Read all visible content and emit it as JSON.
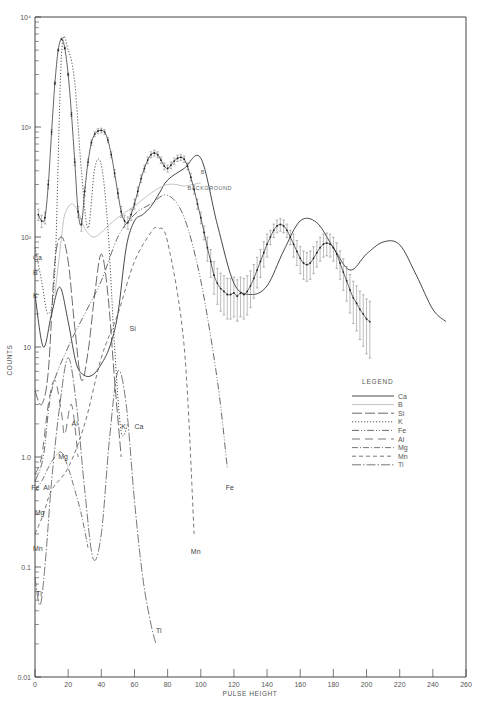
{
  "chart_data": {
    "type": "line",
    "title": "",
    "xlabel": "PULSE HEIGHT",
    "ylabel": "COUNTS",
    "yscale": "log",
    "xlim": [
      0,
      260
    ],
    "ylim": [
      0.01,
      10000
    ],
    "grid": false,
    "x_ticks": [
      0,
      20,
      40,
      60,
      80,
      100,
      120,
      140,
      160,
      180,
      200,
      220,
      240,
      260
    ],
    "y_ticks": [
      {
        "value": 0.01,
        "label": "0.01"
      },
      {
        "value": 0.1,
        "label": "0.1"
      },
      {
        "value": 1,
        "label": "1.0"
      },
      {
        "value": 10,
        "label": "10"
      },
      {
        "value": 100,
        "label": "10²"
      },
      {
        "value": 1000,
        "label": "10³"
      },
      {
        "value": 10000,
        "label": "10⁴"
      }
    ],
    "legend": {
      "title": "LEGEND",
      "position": "right-middle",
      "entries": [
        {
          "name": "Ca",
          "style": "solid"
        },
        {
          "name": "B",
          "style": "faint-solid"
        },
        {
          "name": "Si",
          "style": "long-dash"
        },
        {
          "name": "K",
          "style": "dotted"
        },
        {
          "name": "Fe",
          "style": "dash-dot-dot"
        },
        {
          "name": "Al",
          "style": "dash-long-gap"
        },
        {
          "name": "Mg",
          "style": "dash-dot"
        },
        {
          "name": "Mn",
          "style": "dashed"
        },
        {
          "name": "Ti",
          "style": "dash-dot-long"
        }
      ]
    },
    "annotations": [
      {
        "text": "BACKGROUND",
        "x": 92,
        "y": 270
      },
      {
        "text": "B",
        "x": 100,
        "y": 370
      }
    ],
    "measured": {
      "name": "Measured spectrum (with error bars)",
      "x": [
        2,
        4,
        6,
        8,
        10,
        12,
        14,
        16,
        18,
        20,
        22,
        24,
        26,
        28,
        30,
        32,
        34,
        36,
        38,
        40,
        42,
        44,
        46,
        48,
        50,
        52,
        54,
        56,
        58,
        60,
        62,
        64,
        66,
        68,
        70,
        72,
        74,
        76,
        78,
        80,
        82,
        84,
        86,
        88,
        90,
        92,
        94,
        96,
        98,
        100,
        102,
        104,
        106,
        108,
        110,
        112,
        114,
        116,
        118,
        120,
        122,
        124,
        126,
        128,
        130,
        132,
        134,
        136,
        138,
        140,
        142,
        144,
        146,
        148,
        150,
        152,
        154,
        156,
        158,
        160,
        162,
        164,
        166,
        168,
        170,
        172,
        174,
        176,
        178,
        180,
        182,
        184,
        186,
        188,
        190,
        192,
        194,
        196,
        198,
        200,
        202,
        204,
        206,
        208,
        210,
        212,
        214,
        216,
        218,
        220,
        222,
        224,
        226,
        228,
        230,
        232,
        234,
        236,
        238,
        240,
        242,
        244,
        246,
        248
      ],
      "y": [
        160,
        140,
        150,
        300,
        900,
        2500,
        5000,
        6300,
        5200,
        3000,
        1300,
        480,
        170,
        130,
        260,
        480,
        720,
        860,
        920,
        930,
        900,
        760,
        560,
        380,
        250,
        170,
        140,
        135,
        160,
        200,
        260,
        340,
        420,
        500,
        560,
        580,
        560,
        500,
        440,
        420,
        450,
        490,
        520,
        530,
        510,
        440,
        350,
        270,
        200,
        150,
        110,
        80,
        60,
        45,
        38,
        34,
        32,
        30,
        30,
        31,
        29,
        31,
        30,
        32,
        36,
        42,
        50,
        60,
        72,
        86,
        100,
        115,
        126,
        130,
        126,
        115,
        100,
        86,
        74,
        64,
        58,
        56,
        58,
        64,
        72,
        80,
        86,
        88,
        86,
        80,
        70,
        58,
        48,
        40,
        33,
        28,
        25,
        22,
        20,
        18,
        17
      ]
    },
    "series": [
      {
        "name": "Ca",
        "style": "solid",
        "x": [
          0,
          5,
          10,
          15,
          20,
          25,
          30,
          35,
          40,
          45,
          50,
          55,
          60,
          65,
          70,
          75,
          80,
          90,
          100,
          110,
          120,
          130,
          140,
          150,
          160,
          170,
          180,
          190,
          200,
          210,
          220,
          230,
          240,
          248
        ],
        "y": [
          30,
          10,
          20,
          35,
          17,
          7,
          5.5,
          5.6,
          7,
          10,
          20,
          80,
          140,
          160,
          190,
          250,
          330,
          420,
          520,
          130,
          38,
          30,
          36,
          75,
          140,
          135,
          80,
          50,
          70,
          90,
          85,
          45,
          22,
          17
        ]
      },
      {
        "name": "B",
        "style": "faint-solid",
        "x": [
          12,
          16,
          18,
          22,
          26,
          30,
          35,
          40,
          45,
          50,
          55,
          60,
          65,
          70,
          75,
          80,
          85,
          90,
          95,
          100
        ],
        "y": [
          30,
          100,
          160,
          200,
          170,
          120,
          100,
          110,
          130,
          150,
          170,
          190,
          220,
          250,
          280,
          300,
          300,
          290,
          300,
          310
        ]
      },
      {
        "name": "Si",
        "style": "long-dash",
        "x": [
          0,
          4,
          8,
          12,
          16,
          20,
          24,
          28,
          32,
          36,
          40,
          44,
          48,
          52
        ],
        "y": [
          4,
          3,
          6,
          60,
          100,
          60,
          15,
          5,
          9,
          30,
          70,
          30,
          5,
          1
        ]
      },
      {
        "name": "K",
        "style": "dotted",
        "x": [
          0,
          4,
          8,
          12,
          16,
          20,
          24,
          28,
          32,
          36,
          40,
          44,
          48,
          52,
          56
        ],
        "y": [
          80,
          40,
          20,
          50,
          4500,
          5000,
          2500,
          400,
          120,
          420,
          450,
          120,
          10,
          1.7,
          2
        ]
      },
      {
        "name": "Fe",
        "style": "dash-dot-dot",
        "x": [
          0,
          5,
          10,
          20,
          30,
          40,
          50,
          60,
          70,
          80,
          90,
          100,
          110,
          116
        ],
        "y": [
          0.6,
          1,
          4,
          10,
          20,
          40,
          100,
          160,
          200,
          240,
          150,
          40,
          5,
          0.8
        ]
      },
      {
        "name": "Al",
        "style": "dash-long-gap",
        "x": [
          0,
          4,
          8,
          12,
          16,
          18,
          22,
          26
        ],
        "y": [
          0.7,
          1,
          3,
          5,
          2.5,
          1.6,
          3,
          1
        ]
      },
      {
        "name": "Mg",
        "style": "dash-dot",
        "x": [
          0,
          4,
          8,
          12,
          16,
          20,
          24,
          28,
          32
        ],
        "y": [
          0.5,
          0.6,
          0.8,
          1.0,
          1.1,
          0.8,
          0.5,
          0.3,
          0.15
        ]
      },
      {
        "name": "Mn",
        "style": "dashed",
        "x": [
          0,
          5,
          10,
          20,
          30,
          40,
          50,
          60,
          70,
          74,
          80,
          90,
          96
        ],
        "y": [
          0.2,
          0.3,
          0.5,
          0.8,
          2,
          8,
          20,
          60,
          110,
          120,
          90,
          10,
          0.2
        ]
      },
      {
        "name": "Ti",
        "style": "dash-dot-long",
        "x": [
          0,
          3,
          6,
          10,
          15,
          20,
          25,
          30,
          35,
          40,
          45,
          50,
          55,
          60,
          65,
          70,
          73
        ],
        "y": [
          0.08,
          0.045,
          0.1,
          0.6,
          3,
          8,
          3,
          0.5,
          0.12,
          0.2,
          1.5,
          6,
          3,
          0.4,
          0.08,
          0.03,
          0.02
        ]
      }
    ],
    "curve_labels": [
      {
        "text": "Ca",
        "x": 0,
        "y": 62
      },
      {
        "text": "B",
        "x": 0,
        "y": 45
      },
      {
        "text": "K",
        "x": 0,
        "y": 28
      },
      {
        "text": "Si",
        "x": 57,
        "y": 14
      },
      {
        "text": "K",
        "x": 52,
        "y": 1.8
      },
      {
        "text": "Ca",
        "x": 60,
        "y": 1.8
      },
      {
        "text": "Al",
        "x": 22,
        "y": 1.9
      },
      {
        "text": "Mg",
        "x": 14,
        "y": 0.95
      },
      {
        "text": "Fe",
        "x": -1,
        "y": 0.5
      },
      {
        "text": "Al",
        "x": 5,
        "y": 0.5
      },
      {
        "text": "Mg",
        "x": 1,
        "y": 0.3
      },
      {
        "text": "Mn",
        "x": 0,
        "y": 0.14
      },
      {
        "text": "Ti",
        "x": 2,
        "y": 0.055
      },
      {
        "text": "Fe",
        "x": 115,
        "y": 0.5
      },
      {
        "text": "Mn",
        "x": 94,
        "y": 0.13
      },
      {
        "text": "Ti",
        "x": 73,
        "y": 0.025
      }
    ]
  }
}
